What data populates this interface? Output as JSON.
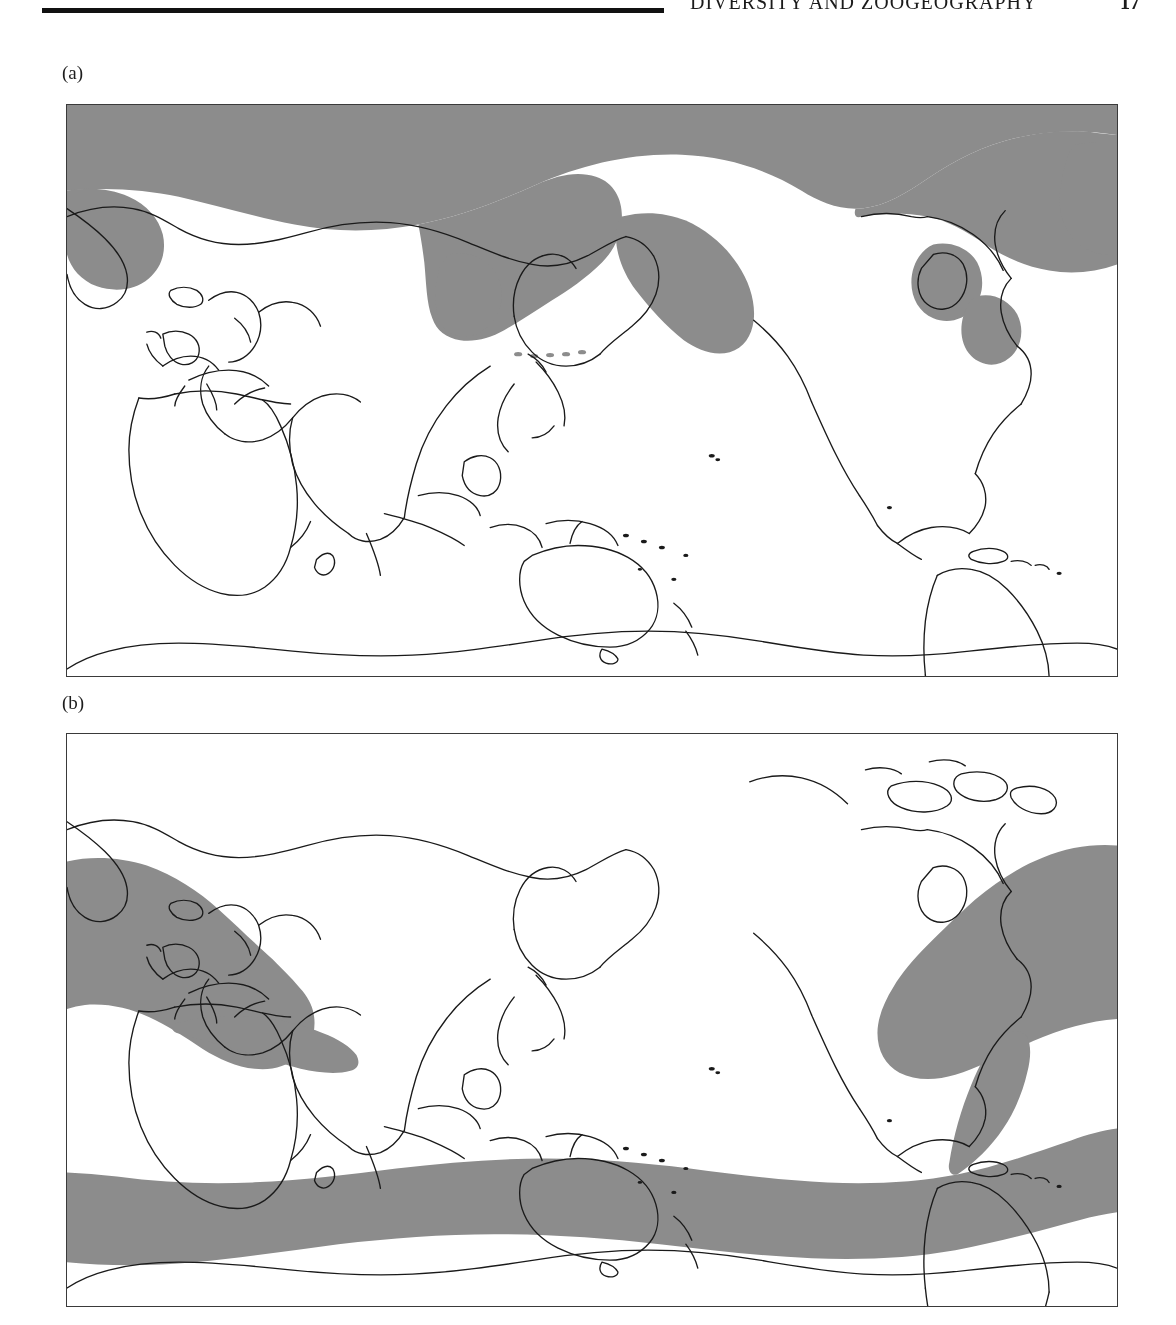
{
  "page": {
    "running_head": "DIVERSITY AND ZOOGEOGRAPHY",
    "page_number": "17",
    "background_color": "#ffffff",
    "text_color": "#1b1b1b"
  },
  "figure": {
    "panels": [
      {
        "label": "(a)",
        "id": "map-a",
        "distribution_name": "Arctic / boreal (northern high-latitude) distribution",
        "shaded_color": "#8c8c8c",
        "outline_color": "#1a1a1a",
        "ocean_color": "#ffffff",
        "frame_color": "#3a3a3a",
        "shaded_regions": [
          "Arctic Ocean",
          "Bering Sea",
          "Sea of Okhotsk",
          "Gulf of Alaska",
          "Aleutian Islands",
          "Canadian Arctic Archipelago",
          "Hudson Bay",
          "Labrador Sea",
          "Greenland coastal waters",
          "Barents Sea",
          "Kara Sea",
          "Laptev Sea"
        ]
      },
      {
        "label": "(b)",
        "id": "map-b",
        "distribution_name": "Antitropical / bipolar distribution",
        "shaded_color": "#8c8c8c",
        "outline_color": "#1a1a1a",
        "ocean_color": "#ffffff",
        "frame_color": "#3a3a3a",
        "shaded_regions": [
          "North Atlantic",
          "Mediterranean Sea",
          "Baltic Sea",
          "North Sea",
          "NW European shelf",
          "Gulf of Maine / Grand Banks",
          "Southern Ocean belt",
          "Southern Australia and Tasmania",
          "New Zealand",
          "Southern South America / Patagonian shelf",
          "Cape region of South Africa"
        ]
      }
    ],
    "projection": {
      "type": "cylindrical equidistant",
      "central_meridian_deg": 180,
      "lon_range_deg": [
        -180,
        180
      ],
      "lat_range_deg": [
        -90,
        90
      ]
    }
  },
  "icons": {
    "panel_marker": "panel-label"
  }
}
